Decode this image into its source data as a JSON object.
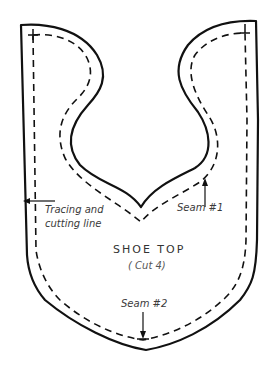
{
  "diagram": {
    "title": "SHOE TOP",
    "subtitle": "( Cut 4)",
    "labels": {
      "cutting_line_1": "Tracing and",
      "cutting_line_2": "cutting line",
      "seam1": "Seam #1",
      "seam2": "Seam #2"
    },
    "colors": {
      "line": "#111111",
      "text": "#3a3a3a",
      "background": "#ffffff"
    }
  }
}
